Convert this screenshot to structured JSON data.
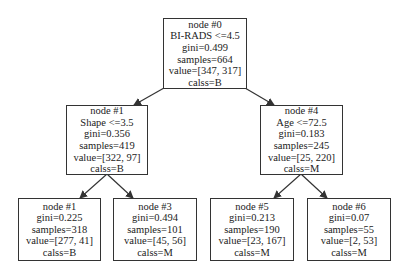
{
  "diagram": {
    "type": "decision-tree",
    "nodes": {
      "root": {
        "lines": [
          "node #0",
          "BI-RADS <=4.5",
          "gini=0.499",
          "samples=664",
          "value=[347, 317]",
          "calss=B"
        ]
      },
      "left": {
        "lines": [
          "node #1",
          "Shape <=3.5",
          "gini=0.356",
          "samples=419",
          "value=[322, 97]",
          "calss=B"
        ]
      },
      "right": {
        "lines": [
          "node #4",
          "Age <=72.5",
          "gini=0.183",
          "samples=245",
          "value=[25, 220]",
          "calss=M"
        ]
      },
      "leaf_ll": {
        "lines": [
          "node #1",
          "gini=0.225",
          "samples=318",
          "value=[277, 41]",
          "calss=B"
        ]
      },
      "leaf_lr": {
        "lines": [
          "node #3",
          "gini=0.494",
          "samples=101",
          "value=[45, 56]",
          "calss=M"
        ]
      },
      "leaf_rl": {
        "lines": [
          "node #5",
          "gini=0.213",
          "samples=190",
          "value=[23, 167]",
          "calss=M"
        ]
      },
      "leaf_rr": {
        "lines": [
          "node #6",
          "gini=0.07",
          "samples=55",
          "value=[2, 53]",
          "calss=M"
        ]
      }
    },
    "edges": [
      [
        "root",
        "left"
      ],
      [
        "root",
        "right"
      ],
      [
        "left",
        "leaf_ll"
      ],
      [
        "left",
        "leaf_lr"
      ],
      [
        "right",
        "leaf_rl"
      ],
      [
        "right",
        "leaf_rr"
      ]
    ],
    "colors": {
      "stroke": "#333333",
      "text": "#222222",
      "background": "#ffffff"
    }
  }
}
